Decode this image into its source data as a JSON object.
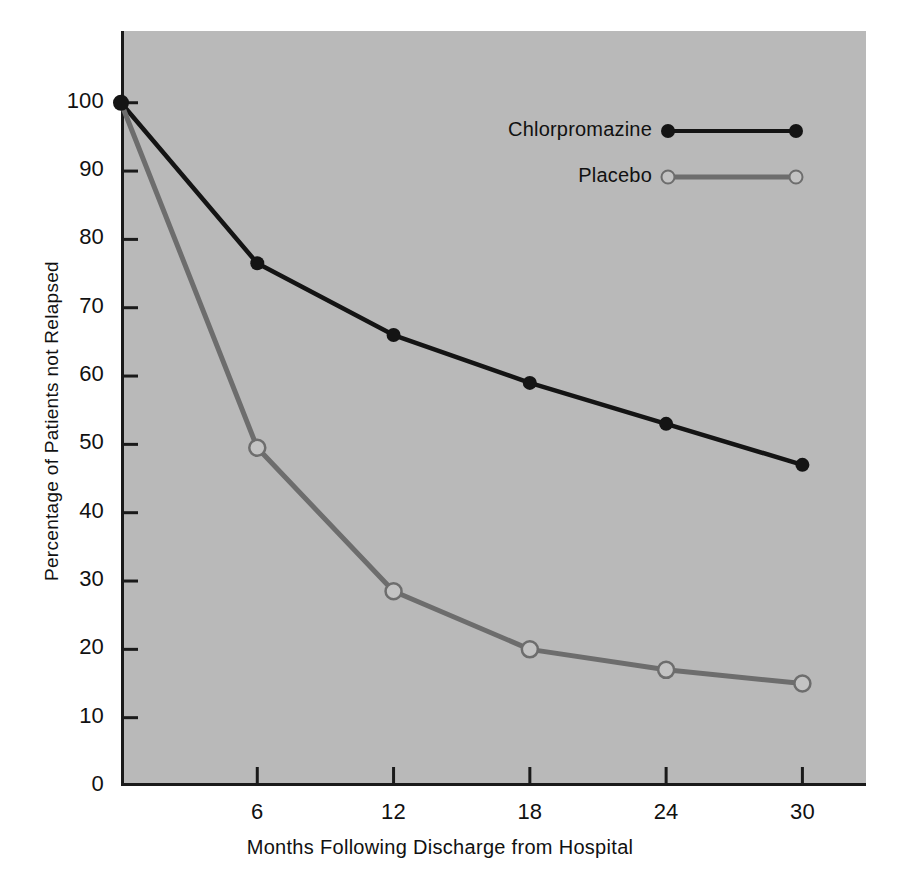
{
  "chart_data": {
    "type": "line",
    "title": "",
    "xlabel": "Months Following Discharge from Hospital",
    "ylabel": "Percentage of Patients not Relapsed",
    "x": [
      0,
      6,
      12,
      18,
      24,
      30
    ],
    "xticks": [
      6,
      12,
      18,
      24,
      30
    ],
    "xtick_labels": [
      "6",
      "12",
      "18",
      "24",
      "30"
    ],
    "yticks": [
      0,
      10,
      20,
      30,
      40,
      50,
      60,
      70,
      80,
      90,
      100
    ],
    "ytick_labels": [
      "0",
      "10",
      "20",
      "30",
      "40",
      "50",
      "60",
      "70",
      "80",
      "90",
      "100"
    ],
    "xlim": [
      0,
      32.8
    ],
    "ylim": [
      0,
      110.5
    ],
    "grid": false,
    "legend_position": "upper right inside",
    "plot_background": "#b9b9b9",
    "figure_background": "#ffffff",
    "series": [
      {
        "name": "Chlorpromazine",
        "color": "#141414",
        "marker": "filled-circle",
        "marker_fill": "#141414",
        "values": [
          100,
          76.5,
          66,
          59,
          53,
          47
        ]
      },
      {
        "name": "Placebo",
        "color": "#6d6d6d",
        "marker": "open-circle",
        "marker_fill": "#c3c3c3",
        "values": [
          100,
          49.5,
          28.5,
          20,
          17,
          15
        ]
      }
    ]
  },
  "legend": {
    "items": [
      {
        "label": "Chlorpromazine"
      },
      {
        "label": "Placebo"
      }
    ]
  },
  "axes": {
    "x_title": "Months Following Discharge from Hospital",
    "y_title": "Percentage of Patients not Relapsed"
  }
}
